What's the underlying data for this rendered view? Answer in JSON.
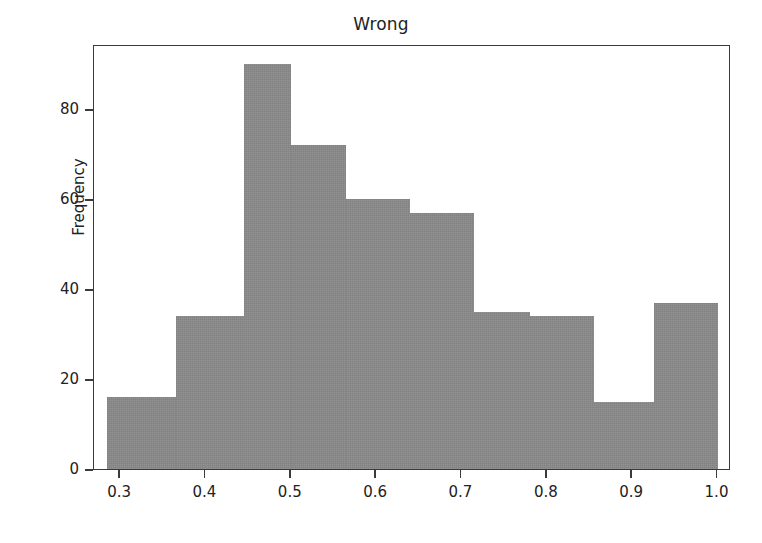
{
  "chart_data": {
    "type": "bar",
    "title": "Wrong",
    "xlabel": "",
    "ylabel": "Frequency",
    "grid": false,
    "legend": null,
    "xlim": [
      0.2694,
      1.0158
    ],
    "ylim": [
      0,
      94.5
    ],
    "xticks": [
      0.3,
      0.4,
      0.5,
      0.6,
      0.7,
      0.8,
      0.9,
      1.0
    ],
    "xticklabels": [
      "0.3",
      "0.4",
      "0.5",
      "0.6",
      "0.7",
      "0.8",
      "0.9",
      "1.0"
    ],
    "yticks": [
      0,
      20,
      40,
      60,
      80
    ],
    "yticklabels": [
      "0",
      "20",
      "40",
      "60",
      "80"
    ],
    "bar_color": "#8a8a8a",
    "bin_edges": [
      0.285,
      0.365,
      0.445,
      0.5,
      0.565,
      0.64,
      0.715,
      0.78,
      0.855,
      0.925,
      1.0
    ],
    "values": [
      16,
      34,
      90,
      72,
      60,
      57,
      35,
      34,
      15,
      37
    ],
    "bars": [
      {
        "x0": 0.285,
        "x1": 0.365,
        "value": 16
      },
      {
        "x0": 0.365,
        "x1": 0.445,
        "value": 34
      },
      {
        "x0": 0.445,
        "x1": 0.5,
        "value": 90
      },
      {
        "x0": 0.5,
        "x1": 0.565,
        "value": 72
      },
      {
        "x0": 0.565,
        "x1": 0.64,
        "value": 60
      },
      {
        "x0": 0.64,
        "x1": 0.715,
        "value": 57
      },
      {
        "x0": 0.715,
        "x1": 0.78,
        "value": 35
      },
      {
        "x0": 0.78,
        "x1": 0.855,
        "value": 34
      },
      {
        "x0": 0.855,
        "x1": 0.925,
        "value": 15
      },
      {
        "x0": 0.925,
        "x1": 1.0,
        "value": 37
      }
    ]
  }
}
